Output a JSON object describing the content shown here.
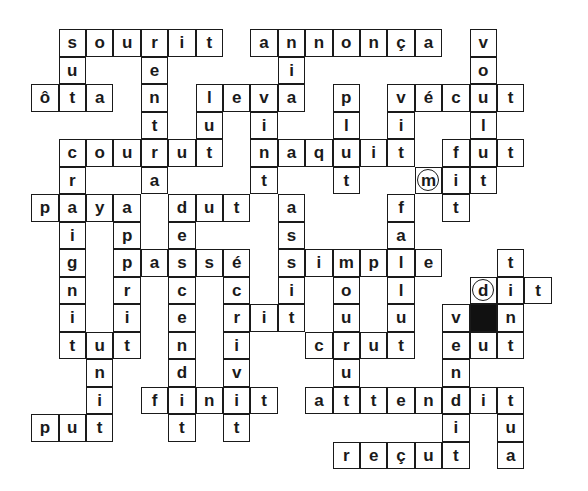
{
  "puzzle": {
    "type": "crossword",
    "grid": {
      "origin_x": 32,
      "origin_y": 30,
      "cell_w": 27.4,
      "cell_h": 27.5,
      "cols": 19,
      "rows": 16
    },
    "words": [
      {
        "word": "sourit",
        "row": 0,
        "col": 1,
        "dir": "across"
      },
      {
        "word": "annonça",
        "row": 0,
        "col": 8,
        "dir": "across"
      },
      {
        "word": "vécut",
        "row": 2,
        "col": 13,
        "dir": "across"
      },
      {
        "word": "ôta",
        "row": 2,
        "col": 0,
        "dir": "across"
      },
      {
        "word": "leva",
        "row": 2,
        "col": 6,
        "dir": "across"
      },
      {
        "word": "courut",
        "row": 4,
        "col": 1,
        "dir": "across"
      },
      {
        "word": "naquit",
        "row": 4,
        "col": 8,
        "dir": "across"
      },
      {
        "word": "fut",
        "row": 4,
        "col": 15,
        "dir": "across"
      },
      {
        "word": "mit",
        "row": 5,
        "col": 14,
        "dir": "across"
      },
      {
        "word": "paya",
        "row": 6,
        "col": 0,
        "dir": "across"
      },
      {
        "word": "dut",
        "row": 6,
        "col": 5,
        "dir": "across"
      },
      {
        "word": "passé",
        "row": 8,
        "col": 3,
        "dir": "across"
      },
      {
        "word": "simple",
        "row": 8,
        "col": 9,
        "dir": "across"
      },
      {
        "word": "dit",
        "row": 9,
        "col": 16,
        "dir": "across"
      },
      {
        "word": "rit",
        "row": 10,
        "col": 7,
        "dir": "across"
      },
      {
        "word": "tut",
        "row": 11,
        "col": 1,
        "dir": "across"
      },
      {
        "word": "crut",
        "row": 11,
        "col": 10,
        "dir": "across"
      },
      {
        "word": "eut",
        "row": 11,
        "col": 15,
        "dir": "across"
      },
      {
        "word": "finit",
        "row": 13,
        "col": 4,
        "dir": "across"
      },
      {
        "word": "attendit",
        "row": 13,
        "col": 10,
        "dir": "across"
      },
      {
        "word": "put",
        "row": 14,
        "col": 0,
        "dir": "across"
      },
      {
        "word": "reçut",
        "row": 15,
        "col": 11,
        "dir": "across"
      }
    ],
    "cells": [
      [
        "0",
        "1",
        "s"
      ],
      [
        "0",
        "2",
        "o"
      ],
      [
        "0",
        "3",
        "u"
      ],
      [
        "0",
        "4",
        "r"
      ],
      [
        "0",
        "5",
        "i"
      ],
      [
        "0",
        "6",
        "t"
      ],
      [
        "0",
        "8",
        "a"
      ],
      [
        "0",
        "9",
        "n"
      ],
      [
        "0",
        "10",
        "n"
      ],
      [
        "0",
        "11",
        "o"
      ],
      [
        "0",
        "12",
        "n"
      ],
      [
        "0",
        "13",
        "ç"
      ],
      [
        "0",
        "14",
        "a"
      ],
      [
        "0",
        "16",
        "v"
      ],
      [
        "1",
        "1",
        "u"
      ],
      [
        "1",
        "4",
        "e"
      ],
      [
        "1",
        "9",
        "i"
      ],
      [
        "1",
        "16",
        "o"
      ],
      [
        "2",
        "0",
        "ô"
      ],
      [
        "2",
        "1",
        "t"
      ],
      [
        "2",
        "2",
        "a"
      ],
      [
        "2",
        "4",
        "n"
      ],
      [
        "2",
        "6",
        "l"
      ],
      [
        "2",
        "7",
        "e"
      ],
      [
        "2",
        "8",
        "v"
      ],
      [
        "2",
        "9",
        "a"
      ],
      [
        "2",
        "11",
        "p"
      ],
      [
        "2",
        "13",
        "v"
      ],
      [
        "2",
        "14",
        "é"
      ],
      [
        "2",
        "15",
        "c"
      ],
      [
        "2",
        "16",
        "u"
      ],
      [
        "2",
        "17",
        "t"
      ],
      [
        "3",
        "4",
        "t"
      ],
      [
        "3",
        "6",
        "u"
      ],
      [
        "3",
        "8",
        "i"
      ],
      [
        "3",
        "11",
        "l"
      ],
      [
        "3",
        "13",
        "i"
      ],
      [
        "3",
        "16",
        "l"
      ],
      [
        "4",
        "1",
        "c"
      ],
      [
        "4",
        "2",
        "o"
      ],
      [
        "4",
        "3",
        "u"
      ],
      [
        "4",
        "4",
        "r"
      ],
      [
        "4",
        "5",
        "u"
      ],
      [
        "4",
        "6",
        "t"
      ],
      [
        "4",
        "8",
        "n"
      ],
      [
        "4",
        "9",
        "a"
      ],
      [
        "4",
        "10",
        "q"
      ],
      [
        "4",
        "11",
        "u"
      ],
      [
        "4",
        "12",
        "i"
      ],
      [
        "4",
        "13",
        "t"
      ],
      [
        "4",
        "15",
        "f"
      ],
      [
        "4",
        "16",
        "u"
      ],
      [
        "4",
        "17",
        "t"
      ],
      [
        "5",
        "1",
        "r"
      ],
      [
        "5",
        "4",
        "a"
      ],
      [
        "5",
        "8",
        "t"
      ],
      [
        "5",
        "11",
        "t"
      ],
      [
        "5",
        "14",
        "m",
        "circled"
      ],
      [
        "5",
        "15",
        "i"
      ],
      [
        "5",
        "16",
        "t"
      ],
      [
        "6",
        "0",
        "p"
      ],
      [
        "6",
        "1",
        "a"
      ],
      [
        "6",
        "2",
        "y"
      ],
      [
        "6",
        "3",
        "a"
      ],
      [
        "6",
        "5",
        "d"
      ],
      [
        "6",
        "6",
        "u"
      ],
      [
        "6",
        "7",
        "t"
      ],
      [
        "6",
        "9",
        "a"
      ],
      [
        "6",
        "13",
        "f"
      ],
      [
        "6",
        "15",
        "t"
      ],
      [
        "7",
        "1",
        "i"
      ],
      [
        "7",
        "3",
        "p"
      ],
      [
        "7",
        "5",
        "e"
      ],
      [
        "7",
        "9",
        "s"
      ],
      [
        "7",
        "13",
        "a"
      ],
      [
        "8",
        "1",
        "g"
      ],
      [
        "8",
        "3",
        "p"
      ],
      [
        "8",
        "4",
        "a"
      ],
      [
        "8",
        "5",
        "s"
      ],
      [
        "8",
        "6",
        "s"
      ],
      [
        "8",
        "7",
        "é"
      ],
      [
        "8",
        "9",
        "s"
      ],
      [
        "8",
        "10",
        "i"
      ],
      [
        "8",
        "11",
        "m"
      ],
      [
        "8",
        "12",
        "p"
      ],
      [
        "8",
        "13",
        "l"
      ],
      [
        "8",
        "14",
        "e"
      ],
      [
        "8",
        "17",
        "t"
      ],
      [
        "9",
        "1",
        "n"
      ],
      [
        "9",
        "3",
        "r"
      ],
      [
        "9",
        "5",
        "c"
      ],
      [
        "9",
        "7",
        "c"
      ],
      [
        "9",
        "9",
        "i"
      ],
      [
        "9",
        "11",
        "o"
      ],
      [
        "9",
        "13",
        "l"
      ],
      [
        "9",
        "16",
        "d",
        "circled"
      ],
      [
        "9",
        "17",
        "i"
      ],
      [
        "9",
        "18",
        "t"
      ],
      [
        "10",
        "1",
        "i"
      ],
      [
        "10",
        "3",
        "i"
      ],
      [
        "10",
        "5",
        "e"
      ],
      [
        "10",
        "7",
        "r"
      ],
      [
        "10",
        "8",
        "i"
      ],
      [
        "10",
        "9",
        "t"
      ],
      [
        "10",
        "11",
        "u"
      ],
      [
        "10",
        "13",
        "u"
      ],
      [
        "10",
        "15",
        "v"
      ],
      [
        "10",
        "16",
        "",
        "black"
      ],
      [
        "10",
        "17",
        "n"
      ],
      [
        "11",
        "1",
        "t"
      ],
      [
        "11",
        "2",
        "u"
      ],
      [
        "11",
        "3",
        "t"
      ],
      [
        "11",
        "5",
        "n"
      ],
      [
        "11",
        "7",
        "i"
      ],
      [
        "11",
        "10",
        "c"
      ],
      [
        "11",
        "11",
        "r"
      ],
      [
        "11",
        "12",
        "u"
      ],
      [
        "11",
        "13",
        "t"
      ],
      [
        "11",
        "15",
        "e"
      ],
      [
        "11",
        "16",
        "u"
      ],
      [
        "11",
        "17",
        "t"
      ],
      [
        "12",
        "2",
        "n"
      ],
      [
        "12",
        "5",
        "d"
      ],
      [
        "12",
        "7",
        "v"
      ],
      [
        "12",
        "11",
        "u"
      ],
      [
        "12",
        "15",
        "n"
      ],
      [
        "13",
        "2",
        "i"
      ],
      [
        "13",
        "4",
        "f"
      ],
      [
        "13",
        "5",
        "i"
      ],
      [
        "13",
        "6",
        "n"
      ],
      [
        "13",
        "7",
        "i"
      ],
      [
        "13",
        "8",
        "t"
      ],
      [
        "13",
        "10",
        "a"
      ],
      [
        "13",
        "11",
        "t"
      ],
      [
        "13",
        "12",
        "t"
      ],
      [
        "13",
        "13",
        "e"
      ],
      [
        "13",
        "14",
        "n"
      ],
      [
        "13",
        "15",
        "d"
      ],
      [
        "13",
        "16",
        "i"
      ],
      [
        "13",
        "17",
        "t"
      ],
      [
        "14",
        "0",
        "p"
      ],
      [
        "14",
        "1",
        "u"
      ],
      [
        "14",
        "2",
        "t"
      ],
      [
        "14",
        "5",
        "t"
      ],
      [
        "14",
        "7",
        "t"
      ],
      [
        "14",
        "15",
        "i"
      ],
      [
        "14",
        "17",
        "u"
      ],
      [
        "15",
        "11",
        "r"
      ],
      [
        "15",
        "12",
        "e"
      ],
      [
        "15",
        "13",
        "ç"
      ],
      [
        "15",
        "14",
        "u"
      ],
      [
        "15",
        "15",
        "t"
      ],
      [
        "15",
        "17",
        "a"
      ]
    ],
    "colors": {
      "ink": "#1a1a1a",
      "background": "#ffffff",
      "black_cell": "#111111"
    }
  }
}
